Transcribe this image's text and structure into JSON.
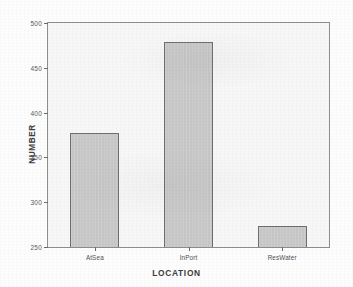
{
  "chart_data": {
    "type": "bar",
    "title": "",
    "subtitle": "",
    "xlabel": "LOCATION",
    "ylabel": "NUMBER",
    "categories": [
      "AtSea",
      "InPort",
      "ResWater"
    ],
    "values": [
      377,
      479,
      274
    ],
    "series": [
      {
        "name": "NUMBER",
        "values": [
          377,
          479,
          274
        ]
      }
    ],
    "ylim": [
      250,
      500
    ],
    "yticks": [
      250,
      300,
      350,
      400,
      450,
      500
    ],
    "ytick_labels": [
      "250",
      "300",
      "350",
      "400",
      "450",
      "500"
    ],
    "xtick_labels": [
      "AtSea",
      "InPort",
      "ResWater"
    ],
    "grid": false,
    "legend": false,
    "legend_position": "none",
    "bar_fill_color": "#c9c9c9",
    "bar_edge_color": "#6e6e6e",
    "plot_background_color": "#f7f7f7",
    "frame_color": "#8e8e8e",
    "axis_text_color": "#4f4f4f",
    "title_text_color": "#3c3c3c"
  }
}
